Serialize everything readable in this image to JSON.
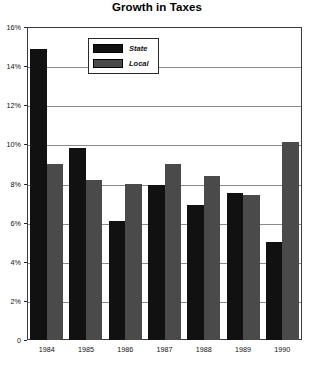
{
  "chart_data": {
    "type": "bar",
    "title": "Growth in Taxes",
    "xlabel": "",
    "ylabel": "",
    "categories": [
      "1984",
      "1985",
      "1986",
      "1987",
      "1988",
      "1989",
      "1990"
    ],
    "series": [
      {
        "name": "State",
        "color": "#111111",
        "values": [
          14.9,
          9.8,
          6.1,
          7.9,
          6.9,
          7.5,
          5.0
        ]
      },
      {
        "name": "Local",
        "color": "#4a4a4a",
        "values": [
          9.0,
          8.2,
          8.0,
          9.0,
          8.4,
          7.4,
          10.1
        ]
      }
    ],
    "ylim": [
      0,
      16
    ],
    "ytick_values": [
      0,
      2,
      4,
      6,
      8,
      10,
      12,
      14,
      16
    ],
    "ytick_labels": [
      "0",
      "2%",
      "4%",
      "6%",
      "8%",
      "10%",
      "12%",
      "14%",
      "16%"
    ],
    "grid": true,
    "legend_position": "top-left-inside"
  },
  "legend": {
    "entries": [
      {
        "label": "State",
        "swatch": "black-swatch"
      },
      {
        "label": "Local",
        "swatch": "gray-swatch"
      }
    ]
  }
}
